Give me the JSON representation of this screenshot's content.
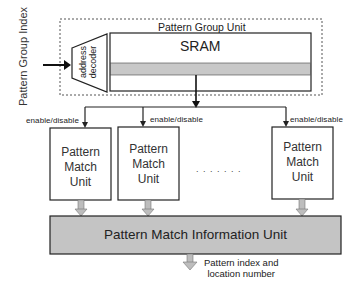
{
  "diagram": {
    "input_label": "Pattern Group Index",
    "group_unit": {
      "title": "Pattern Group Unit",
      "decoder_label_line1": "address",
      "decoder_label_line2": "decoder",
      "memory_label": "SRAM"
    },
    "match_units": [
      {
        "line1": "Pattern",
        "line2": "Match",
        "line3": "Unit",
        "control": "enable/disable"
      },
      {
        "line1": "Pattern",
        "line2": "Match",
        "line3": "Unit",
        "control": "enable/disable"
      },
      {
        "line1": "Pattern",
        "line2": "Match",
        "line3": "Unit",
        "control": "enable/disable"
      }
    ],
    "ellipsis": ". . . . . . .",
    "info_unit": {
      "label": "Pattern Match Information Unit"
    },
    "output_label_line1": "Pattern index and",
    "output_label_line2": "location number"
  },
  "colors": {
    "line": "#222222",
    "gray_fill": "#c4c4c4",
    "gray_band": "#c8c8c8",
    "hollow_arrow_fill": "#bdbdbd",
    "dashed_border": "#555555"
  }
}
